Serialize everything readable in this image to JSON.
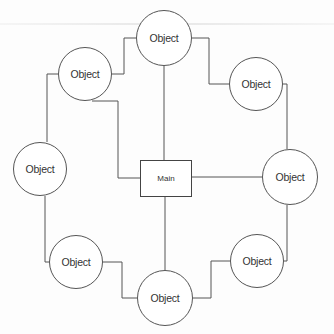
{
  "diagram": {
    "type": "hub-and-ring",
    "stroke_color": "#555555",
    "hub": {
      "label": "Main",
      "x": 140,
      "y": 160,
      "w": 52,
      "h": 37
    },
    "nodes": [
      {
        "id": "top",
        "label": "Object",
        "cx": 164,
        "cy": 38,
        "r": 28
      },
      {
        "id": "upper-left",
        "label": "Object",
        "cx": 85,
        "cy": 74,
        "r": 27
      },
      {
        "id": "upper-right",
        "label": "Object",
        "cx": 256,
        "cy": 84,
        "r": 27
      },
      {
        "id": "left",
        "label": "Object",
        "cx": 40,
        "cy": 169,
        "r": 27
      },
      {
        "id": "right",
        "label": "Object",
        "cx": 290,
        "cy": 177,
        "r": 28
      },
      {
        "id": "lower-left",
        "label": "Object",
        "cx": 76,
        "cy": 262,
        "r": 27
      },
      {
        "id": "bottom",
        "label": "Object",
        "cx": 165,
        "cy": 298,
        "r": 28
      },
      {
        "id": "lower-right",
        "label": "Object",
        "cx": 257,
        "cy": 261,
        "r": 27
      }
    ],
    "connectors": [
      {
        "from": "top",
        "to": "hub",
        "points": "164,66 164,160"
      },
      {
        "from": "bottom",
        "to": "hub",
        "points": "165,270 165,197"
      },
      {
        "from": "right",
        "to": "hub",
        "points": "262,177 192,177"
      },
      {
        "from": "upper-left",
        "to": "hub",
        "points": "92,101 118,101 118,178 140,178"
      },
      {
        "from": "top",
        "to": "upper-left",
        "points": "136,38 124,38 124,74 112,74"
      },
      {
        "from": "top",
        "to": "upper-right",
        "points": "192,38 209,38 209,84 229,84"
      },
      {
        "from": "upper-right",
        "to": "right",
        "points": "283,84 287,84 287,149"
      },
      {
        "from": "right",
        "to": "lower-right",
        "points": "287,205 287,261 284,261"
      },
      {
        "from": "lower-right",
        "to": "bottom",
        "points": "230,261 211,261 211,298 193,298"
      },
      {
        "from": "bottom",
        "to": "lower-left",
        "points": "137,298 122,298 122,262 103,262"
      },
      {
        "from": "lower-left",
        "to": "left",
        "points": "49,262 45,262 45,196"
      },
      {
        "from": "left",
        "to": "upper-left",
        "points": "47,142 47,74 58,74"
      }
    ]
  }
}
